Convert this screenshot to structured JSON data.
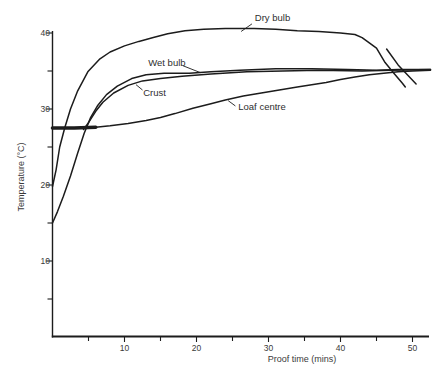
{
  "figure": {
    "background": "#ffffff",
    "line_color": "#1c1c1c",
    "text_color": "#3a3a3a"
  },
  "chart_data": {
    "type": "line",
    "title": "",
    "xlabel": "Proof time (mins)",
    "ylabel": "Temperature (°C)",
    "xlim": [
      0,
      52.5
    ],
    "ylim": [
      0,
      42.5
    ],
    "x_ticks_labeled": [
      10,
      20,
      30,
      40,
      50
    ],
    "x_ticks_minor": [
      5,
      15,
      25,
      35,
      45
    ],
    "y_ticks_labeled": [
      10,
      20,
      30,
      40
    ],
    "y_ticks_minor": [
      5,
      15,
      25,
      35
    ],
    "grid": false,
    "legend_position": "inline-annotations",
    "series": [
      {
        "name": "Dry bulb",
        "width": 1.5,
        "points": [
          [
            0,
            19.8
          ],
          [
            0.5,
            22
          ],
          [
            1,
            25
          ],
          [
            1.7,
            27.5
          ],
          [
            2.5,
            30
          ],
          [
            3.5,
            32.4
          ],
          [
            4.9,
            34.9
          ],
          [
            6.6,
            36.6
          ],
          [
            8,
            37.5
          ],
          [
            10,
            38.3
          ],
          [
            12,
            38.9
          ],
          [
            14,
            39.4
          ],
          [
            16,
            39.9
          ],
          [
            18.4,
            40.3
          ],
          [
            21,
            40.5
          ],
          [
            24,
            40.6
          ],
          [
            28,
            40.6
          ],
          [
            31,
            40.5
          ],
          [
            34,
            40.3
          ],
          [
            37,
            40.2
          ],
          [
            40,
            40
          ],
          [
            42,
            39.8
          ],
          [
            43,
            39.4
          ],
          [
            44,
            38.7
          ],
          [
            45,
            38
          ],
          [
            46.2,
            36.1
          ],
          [
            47.5,
            34.6
          ],
          [
            48.6,
            33.4
          ],
          [
            49,
            32.9
          ]
        ]
      },
      {
        "name": "Dry bulb end trace",
        "width": 1.5,
        "points": [
          [
            46.4,
            37.9
          ],
          [
            48,
            35.8
          ],
          [
            50.5,
            33.3
          ]
        ]
      },
      {
        "name": "Wet bulb",
        "width": 1.5,
        "points": [
          [
            0,
            15
          ],
          [
            0.7,
            16.5
          ],
          [
            1.5,
            18.5
          ],
          [
            2.5,
            21.2
          ],
          [
            3.5,
            24.2
          ],
          [
            4.4,
            26.8
          ],
          [
            5.3,
            28.9
          ],
          [
            6.3,
            30.5
          ],
          [
            7.5,
            31.9
          ],
          [
            9,
            33
          ],
          [
            11,
            34
          ],
          [
            13,
            34.5
          ],
          [
            15.5,
            34.7
          ],
          [
            19,
            34.7
          ],
          [
            22,
            34.9
          ],
          [
            26,
            35.1
          ],
          [
            31,
            35.3
          ],
          [
            36,
            35.3
          ],
          [
            41,
            35.2
          ],
          [
            45,
            35.1
          ],
          [
            48,
            35.2
          ],
          [
            52.5,
            35.2
          ]
        ]
      },
      {
        "name": "Crust",
        "width": 1.5,
        "points": [
          [
            4.3,
            27.3
          ],
          [
            5,
            28.2
          ],
          [
            6,
            29.7
          ],
          [
            7,
            30.9
          ],
          [
            8.5,
            32.1
          ],
          [
            10.5,
            33.1
          ],
          [
            12.5,
            33.7
          ],
          [
            15,
            34
          ],
          [
            18,
            34.3
          ],
          [
            22,
            34.6
          ],
          [
            27,
            34.9
          ],
          [
            32,
            35
          ],
          [
            37,
            35.1
          ],
          [
            43,
            35
          ],
          [
            47,
            35.1
          ],
          [
            52.5,
            35.2
          ]
        ]
      },
      {
        "name": "Loaf centre",
        "width": 1.5,
        "thick_until_t": 6,
        "thick_width": 3.6,
        "points": [
          [
            0,
            27.5
          ],
          [
            3,
            27.5
          ],
          [
            6,
            27.6
          ],
          [
            8,
            27.8
          ],
          [
            10.5,
            28.1
          ],
          [
            13,
            28.5
          ],
          [
            15,
            28.9
          ],
          [
            17,
            29.4
          ],
          [
            19.5,
            30.1
          ],
          [
            22,
            30.7
          ],
          [
            24,
            31.2
          ],
          [
            26.5,
            31.7
          ],
          [
            29,
            32.1
          ],
          [
            31.5,
            32.5
          ],
          [
            34,
            32.9
          ],
          [
            36,
            33.2
          ],
          [
            38,
            33.5
          ],
          [
            40,
            33.9
          ],
          [
            42,
            34.2
          ],
          [
            44,
            34.5
          ],
          [
            46,
            34.7
          ],
          [
            48,
            34.9
          ],
          [
            50,
            35
          ],
          [
            52.5,
            35.1
          ]
        ]
      }
    ],
    "annotations": [
      {
        "text": "Dry bulb",
        "t": 28.1,
        "T": 42.0,
        "leader": [
          [
            26.2,
            40.2
          ],
          [
            27.7,
            41.2
          ]
        ]
      },
      {
        "text": "Wet bulb",
        "t": 13.3,
        "T": 36.1,
        "leader": [
          [
            18.1,
            35.7
          ],
          [
            20.5,
            34.8
          ]
        ]
      },
      {
        "text": "Crust",
        "t": 12.6,
        "T": 32.1,
        "leader": [
          [
            12.5,
            32.5
          ],
          [
            11.6,
            33.2
          ]
        ]
      },
      {
        "text": "Loaf centre",
        "t": 25.8,
        "T": 30.3,
        "leader": [
          [
            25.4,
            30.4
          ],
          [
            24.4,
            31.1
          ]
        ]
      }
    ]
  }
}
